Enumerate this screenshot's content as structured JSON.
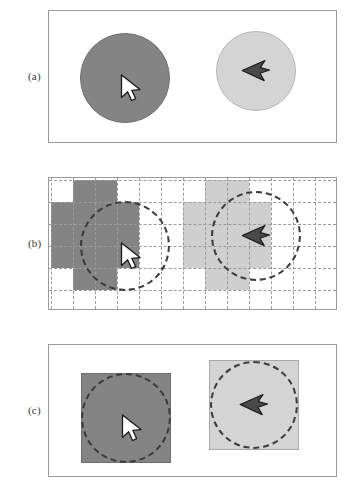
{
  "figure": {
    "title": "",
    "background_color": "#ffffff",
    "width": 352,
    "height": 495
  },
  "colors": {
    "dark_gray": "#848484",
    "light_gray": "#d4d4d4",
    "cell_light_gray": "#cfcfcf",
    "panel_border": "#9a9a9a",
    "gridline": "#9b9b9b",
    "dash_outline": "#3c3c3c",
    "cursor_white_fill": "#ffffff",
    "cursor_white_stroke": "#1a1a1a",
    "cursor_dark_fill": "#4a4a4a",
    "cursor_dark_stroke": "#1a1a1a",
    "label_text": "#3a3a3a",
    "page_background": "#ffffff"
  },
  "panels": [
    {
      "id": "a",
      "label": "(a)",
      "caption": "",
      "bounds": {
        "x": 48,
        "y": 10,
        "width": 289,
        "height": 133
      },
      "label_position": {
        "x": 28,
        "y": 70
      },
      "kind": "smooth-circles",
      "shapes": [
        {
          "name": "dark-circle",
          "shade": "dark",
          "fill": "#848484",
          "center": {
            "x": 76,
            "y": 67
          },
          "radius": 45,
          "cursor": "white-arrow-down-right"
        },
        {
          "name": "light-circle",
          "shade": "light",
          "fill": "#d4d4d4",
          "center": {
            "x": 207,
            "y": 60
          },
          "radius": 40,
          "cursor": "dark-arrow-left"
        }
      ]
    },
    {
      "id": "b",
      "label": "(b)",
      "caption": "",
      "bounds": {
        "x": 48,
        "y": 177,
        "width": 289,
        "height": 133
      },
      "label_position": {
        "x": 28,
        "y": 237
      },
      "kind": "rasterized-grid",
      "grid": {
        "cell_size": 22,
        "columns": 13,
        "rows": 6,
        "line_style": "dashed",
        "line_color": "#9b9b9b",
        "origin": {
          "x": 2,
          "y": 2
        }
      },
      "shapes": [
        {
          "name": "dark-raster-blob",
          "shade": "dark",
          "fill": "#848484",
          "center": {
            "x": 76,
            "y": 68
          },
          "radius": 45,
          "cursor": "white-arrow-down-right",
          "cells": [
            [
              1,
              0
            ],
            [
              2,
              0
            ],
            [
              0,
              1
            ],
            [
              1,
              1
            ],
            [
              2,
              1
            ],
            [
              3,
              1
            ],
            [
              0,
              2
            ],
            [
              1,
              2
            ],
            [
              2,
              2
            ],
            [
              3,
              2
            ],
            [
              0,
              3
            ],
            [
              1,
              3
            ],
            [
              2,
              3
            ],
            [
              3,
              3
            ],
            [
              1,
              4
            ],
            [
              2,
              4
            ]
          ]
        },
        {
          "name": "light-raster-blob",
          "shade": "light",
          "fill": "#cfcfcf",
          "center": {
            "x": 207,
            "y": 58
          },
          "radius": 45,
          "cursor": "dark-arrow-left",
          "cells": [
            [
              7,
              0
            ],
            [
              8,
              0
            ],
            [
              6,
              1
            ],
            [
              7,
              1
            ],
            [
              8,
              1
            ],
            [
              9,
              1
            ],
            [
              6,
              2
            ],
            [
              7,
              2
            ],
            [
              8,
              2
            ],
            [
              9,
              2
            ],
            [
              6,
              3
            ],
            [
              7,
              3
            ],
            [
              8,
              3
            ],
            [
              9,
              3
            ],
            [
              7,
              4
            ],
            [
              8,
              4
            ]
          ]
        }
      ]
    },
    {
      "id": "c",
      "label": "(c)",
      "caption": "",
      "bounds": {
        "x": 48,
        "y": 344,
        "width": 289,
        "height": 133
      },
      "label_position": {
        "x": 28,
        "y": 404
      },
      "kind": "bounding-boxes",
      "shapes": [
        {
          "name": "dark-square",
          "shade": "dark",
          "fill": "#848484",
          "box": {
            "x": 32,
            "y": 28,
            "width": 90,
            "height": 90
          },
          "dashed_circle": {
            "cx": 77,
            "cy": 73,
            "r": 45
          },
          "cursor": "white-arrow-down-right"
        },
        {
          "name": "light-square",
          "shade": "light",
          "fill": "#d4d4d4",
          "box": {
            "x": 160,
            "y": 15,
            "width": 90,
            "height": 90
          },
          "dashed_circle": {
            "cx": 205,
            "cy": 60,
            "r": 44
          },
          "cursor": "dark-arrow-left"
        }
      ]
    }
  ],
  "cursors": {
    "white_arrow": {
      "name": "white-arrow-down-right",
      "direction": "down-right",
      "fill": "#ffffff",
      "stroke": "#1a1a1a"
    },
    "dark_arrow": {
      "name": "dark-arrow-left",
      "direction": "left",
      "fill": "#4a4a4a",
      "stroke": "#1a1a1a"
    }
  }
}
